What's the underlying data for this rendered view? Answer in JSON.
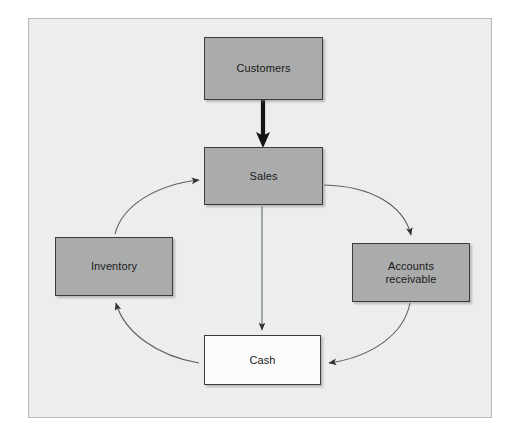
{
  "figure": {
    "kind": "cycle-flow-diagram",
    "frame_background": "#eceded",
    "frame_border": "#b9bbbb"
  },
  "nodes": [
    {
      "id": "customers",
      "label": "Customers",
      "fill": "#aaabab",
      "style": "filled"
    },
    {
      "id": "sales",
      "label": "Sales",
      "fill": "#aaabab",
      "style": "filled"
    },
    {
      "id": "accounts_receivable",
      "label_line1": "Accounts",
      "label_line2": "receivable",
      "fill": "#aaabab",
      "style": "filled"
    },
    {
      "id": "inventory",
      "label": "Inventory",
      "fill": "#aaabab",
      "style": "filled"
    },
    {
      "id": "cash",
      "label": "Cash",
      "fill": "#fbfbfb",
      "style": "hollow"
    }
  ],
  "connectors": [
    {
      "id": "customers-to-sales",
      "from": "customers",
      "to": "sales",
      "shape": "straight",
      "weight": "thick",
      "color": "#141414"
    },
    {
      "id": "sales-to-cash",
      "from": "sales",
      "to": "cash",
      "shape": "straight",
      "weight": "thin",
      "color": "#555758"
    },
    {
      "id": "sales-to-accounts-receivable",
      "from": "sales",
      "to": "accounts_receivable",
      "shape": "curved",
      "weight": "thin",
      "color": "#55585a"
    },
    {
      "id": "accounts-receivable-to-cash",
      "from": "accounts_receivable",
      "to": "cash",
      "shape": "curved",
      "weight": "thin",
      "color": "#55585a"
    },
    {
      "id": "cash-to-inventory",
      "from": "cash",
      "to": "inventory",
      "shape": "curved",
      "weight": "thin",
      "color": "#55585a"
    },
    {
      "id": "inventory-to-sales",
      "from": "inventory",
      "to": "sales",
      "shape": "curved",
      "weight": "thin",
      "color": "#55585a"
    }
  ]
}
